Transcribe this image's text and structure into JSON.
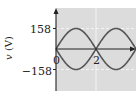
{
  "chart_data": {
    "type": "line",
    "title": "",
    "xlabel": "",
    "ylabel": "v (V)",
    "x_ticks": [
      "0",
      "2"
    ],
    "y_ticks": [
      "158",
      "-158"
    ],
    "xlim": [
      0,
      4
    ],
    "ylim": [
      -158,
      158
    ],
    "grid": true,
    "legend": null,
    "series": [
      {
        "name": "v1",
        "formula": "158*sin(pi*t/2)",
        "x": [
          0,
          0.5,
          1,
          1.5,
          2,
          2.5,
          3,
          3.5,
          4
        ],
        "values": [
          0,
          111.7,
          158,
          111.7,
          0,
          -111.7,
          -158,
          -111.7,
          0
        ]
      },
      {
        "name": "v2",
        "formula": "-158*sin(pi*t/2)",
        "x": [
          0,
          0.5,
          1,
          1.5,
          2,
          2.5,
          3,
          3.5,
          4
        ],
        "values": [
          0,
          -111.7,
          -158,
          -111.7,
          0,
          111.7,
          158,
          111.7,
          0
        ]
      }
    ],
    "colors": {
      "plot_background": "#dcdcdc",
      "curve": "#555555",
      "axis": "#222222",
      "grid": "#f4f4f4"
    }
  },
  "labels": {
    "ylabel_italic": "v",
    "ylabel_unit": " (V)",
    "ytick_top": "158",
    "ytick_bottom": "−158",
    "xtick_0": "0",
    "xtick_2": "2"
  }
}
